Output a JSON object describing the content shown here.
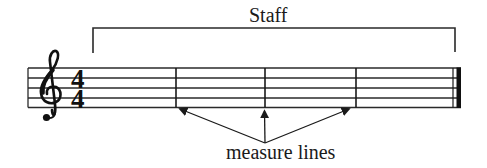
{
  "diagram": {
    "title_label": "Staff",
    "annotation_label": "measure lines",
    "clef": "treble-clef",
    "time_signature": {
      "numerator": "4",
      "denominator": "4"
    },
    "staff": {
      "line_count": 5,
      "measure_count": 4,
      "measure_lines": 3,
      "ending": "final-barline"
    },
    "colors": {
      "ink": "#1a1a1a",
      "background": "#ffffff"
    }
  }
}
